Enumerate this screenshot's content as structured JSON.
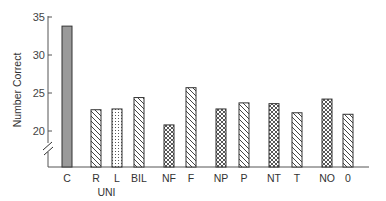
{
  "chart_data": {
    "type": "bar",
    "title": "",
    "xlabel": "",
    "ylabel": "Number Correct",
    "ylim": [
      15,
      35
    ],
    "y_axis_break": true,
    "yticks": [
      20,
      25,
      30,
      35
    ],
    "grid": false,
    "legend": null,
    "categories": [
      "C",
      "R",
      "L",
      "BIL",
      "NF",
      "F",
      "NP",
      "P",
      "NT",
      "T",
      "NO",
      "0"
    ],
    "values": [
      33.8,
      22.8,
      22.9,
      24.4,
      20.8,
      25.7,
      22.9,
      23.7,
      23.6,
      22.4,
      24.2,
      22.2
    ],
    "patterns": [
      "solid-gray",
      "diagonal",
      "dotted",
      "diagonal",
      "crosshatch",
      "diagonal",
      "crosshatch",
      "diagonal",
      "crosshatch",
      "diagonal",
      "crosshatch",
      "diagonal"
    ],
    "group_labels": [
      {
        "label": "UNI",
        "spans": [
          "R",
          "L"
        ]
      }
    ]
  },
  "colors": {
    "axis": "#555555",
    "bar_outline": "#333333",
    "solid_bar": "#9a9a9a",
    "hatch": "#444444"
  }
}
